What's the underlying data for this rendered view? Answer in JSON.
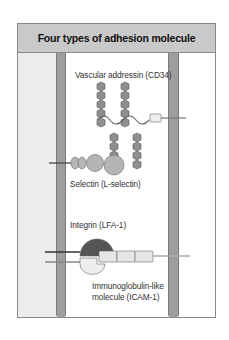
{
  "diagram": {
    "title": "Four types of adhesion molecule",
    "labels": {
      "cd34": "Vascular addressin (CD34)",
      "selectin": "Selectin (L-selectin)",
      "integrin": "Integrin (LFA-1)",
      "icam_line1": "Immunoglobulin-like",
      "icam_line2": "molecule (ICAM-1)"
    },
    "colors": {
      "header": "#c9c9c9",
      "membrane": "#9e9e9e",
      "left_panel": "#ececec",
      "glycan": "#8f8f8f",
      "selectin": "#b5b5b5",
      "integrin_top": "#555555",
      "ig_domain": "#e6e6e6"
    }
  }
}
